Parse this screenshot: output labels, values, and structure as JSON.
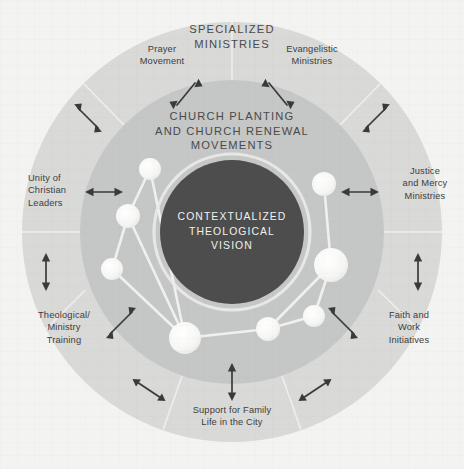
{
  "diagram": {
    "title_center": "CONTEXTUALIZED\nTHEOLOGICAL\nVISION",
    "ring_middle_label": "CHURCH PLANTING\nAND CHURCH RENEWAL\nMOVEMENTS",
    "ring_outer_label": "SPECIALIZED\nMINISTRIES",
    "colors": {
      "background": "#f3f3f1",
      "outer_ring": "#d9d9d7",
      "middle_ring": "#c5c7c6",
      "center_circle": "#4d4d4d",
      "center_ring_stroke": "#f0f0ee",
      "node_fill": "#f5f5f3",
      "link_stroke": "#f2f2f0",
      "text_dark": "#3d3d3d",
      "arrow": "#3a3a3a"
    },
    "outer_labels": [
      {
        "id": "prayer-movement",
        "text": "Prayer\nMovement",
        "align": "center"
      },
      {
        "id": "evangelistic-ministries",
        "text": "Evangelistic\nMinistries",
        "align": "center"
      },
      {
        "id": "justice-mercy",
        "text": "Justice\nand Mercy\nMinistries",
        "align": "center"
      },
      {
        "id": "faith-work",
        "text": "Faith and\nWork\nInitiatives",
        "align": "center"
      },
      {
        "id": "support-family-life",
        "text": "Support for Family\nLife in the City",
        "align": "center"
      },
      {
        "id": "theological-training",
        "text": "Theological/\nMinistry\nTraining",
        "align": "center"
      },
      {
        "id": "unity-christian-leaders",
        "text": "Unity of\nChristian\nLeaders",
        "align": "left"
      }
    ],
    "geometry": {
      "center_x": 232,
      "center_y": 232,
      "r_outer": 210,
      "r_middle": 152,
      "r_center": 72
    },
    "network_nodes": [
      {
        "id": "n1",
        "cx": 150,
        "cy": 169,
        "r": 11
      },
      {
        "id": "n2",
        "cx": 128,
        "cy": 216,
        "r": 12
      },
      {
        "id": "n3",
        "cx": 112,
        "cy": 269,
        "r": 11
      },
      {
        "id": "n4",
        "cx": 185,
        "cy": 338,
        "r": 16
      },
      {
        "id": "n5",
        "cx": 268,
        "cy": 329,
        "r": 12
      },
      {
        "id": "n6",
        "cx": 314,
        "cy": 316,
        "r": 11
      },
      {
        "id": "n7",
        "cx": 331,
        "cy": 265,
        "r": 17
      },
      {
        "id": "n8",
        "cx": 324,
        "cy": 184,
        "r": 12
      }
    ],
    "network_links": [
      {
        "from": "n1",
        "to": "n2"
      },
      {
        "from": "n2",
        "to": "n3"
      },
      {
        "from": "n2",
        "to": "n4"
      },
      {
        "from": "n3",
        "to": "n4"
      },
      {
        "from": "n4",
        "to": "n5"
      },
      {
        "from": "n5",
        "to": "n6"
      },
      {
        "from": "n6",
        "to": "n7"
      },
      {
        "from": "n7",
        "to": "n8"
      },
      {
        "from": "n7",
        "to": "n5"
      },
      {
        "from": "n4",
        "to": "n1"
      }
    ]
  }
}
